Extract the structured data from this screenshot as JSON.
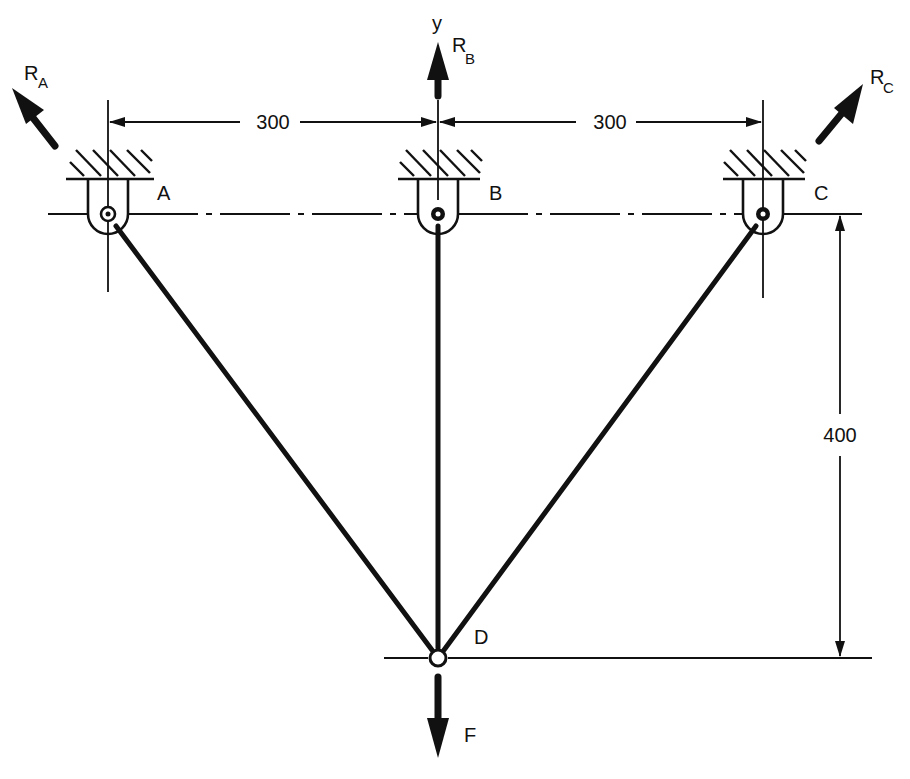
{
  "diagram": {
    "title": "",
    "axis_label": "y",
    "supports": [
      {
        "id": "A",
        "label": "A",
        "x": 108,
        "reaction": {
          "label": "R",
          "subscript": "A"
        }
      },
      {
        "id": "B",
        "label": "B",
        "x": 438,
        "reaction": {
          "label": "R",
          "subscript": "B"
        }
      },
      {
        "id": "C",
        "label": "C",
        "x": 763,
        "reaction": {
          "label": "R",
          "subscript": "C"
        }
      }
    ],
    "joint": {
      "id": "D",
      "label": "D"
    },
    "load": {
      "label": "F",
      "direction": "down"
    },
    "members": [
      {
        "from": "A",
        "to": "D"
      },
      {
        "from": "B",
        "to": "D"
      },
      {
        "from": "C",
        "to": "D"
      }
    ],
    "dimensions": {
      "horizontal_AB": "300",
      "horizontal_BC": "300",
      "vertical_support_to_D": "400"
    },
    "colors": {
      "ink": "#111111",
      "background": "#ffffff"
    }
  }
}
